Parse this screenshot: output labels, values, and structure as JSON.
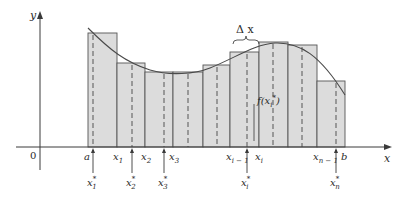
{
  "figure": {
    "axes": {
      "x_label": "x",
      "y_label": "y",
      "origin_label": "0"
    },
    "colors": {
      "rect_fill": "#dcdcdc",
      "rect_stroke": "#555555",
      "curve": "#4a4a4a",
      "axis": "#3a3a3a",
      "text": "#2a2a2a"
    },
    "partition_labels": [
      {
        "text": "a",
        "sub": "",
        "x": 88
      },
      {
        "text": "x",
        "sub": "1",
        "x": 117
      },
      {
        "text": "x",
        "sub": "2",
        "x": 145
      },
      {
        "text": "x",
        "sub": "3",
        "x": 173
      },
      {
        "text": "x",
        "sub": "i − 1",
        "x": 230
      },
      {
        "text": "x",
        "sub": "i",
        "x": 259
      },
      {
        "text": "x",
        "sub": "n − 1",
        "x": 317
      },
      {
        "text": "b",
        "sub": "",
        "x": 345
      }
    ],
    "sample_labels": [
      {
        "text": "x",
        "sub": "1",
        "x": 93
      },
      {
        "text": "x",
        "sub": "2",
        "x": 132
      },
      {
        "text": "x",
        "sub": "3",
        "x": 164
      },
      {
        "text": "x",
        "sub": "i",
        "x": 247
      },
      {
        "text": "x",
        "sub": "n",
        "x": 336
      }
    ],
    "rectangles": [
      {
        "x0": 88,
        "x1": 117,
        "top": 33,
        "sample_x": 93
      },
      {
        "x0": 117,
        "x1": 145,
        "top": 63,
        "sample_x": 132
      },
      {
        "x0": 145,
        "x1": 173,
        "top": 72,
        "sample_x": 164
      },
      {
        "x0": 173,
        "x1": 203,
        "top": 72,
        "sample_x": 188
      },
      {
        "x0": 203,
        "x1": 230,
        "top": 65,
        "sample_x": 217
      },
      {
        "x0": 230,
        "x1": 259,
        "top": 52,
        "sample_x": 247
      },
      {
        "x0": 259,
        "x1": 288,
        "top": 42,
        "sample_x": 273
      },
      {
        "x0": 288,
        "x1": 317,
        "top": 45,
        "sample_x": 302
      },
      {
        "x0": 317,
        "x1": 345,
        "top": 81,
        "sample_x": 336
      }
    ],
    "delta_x_label": "Δ x",
    "height_label": "f(x",
    "height_label_sub": "i",
    "height_label_close": ")",
    "star": "*"
  }
}
